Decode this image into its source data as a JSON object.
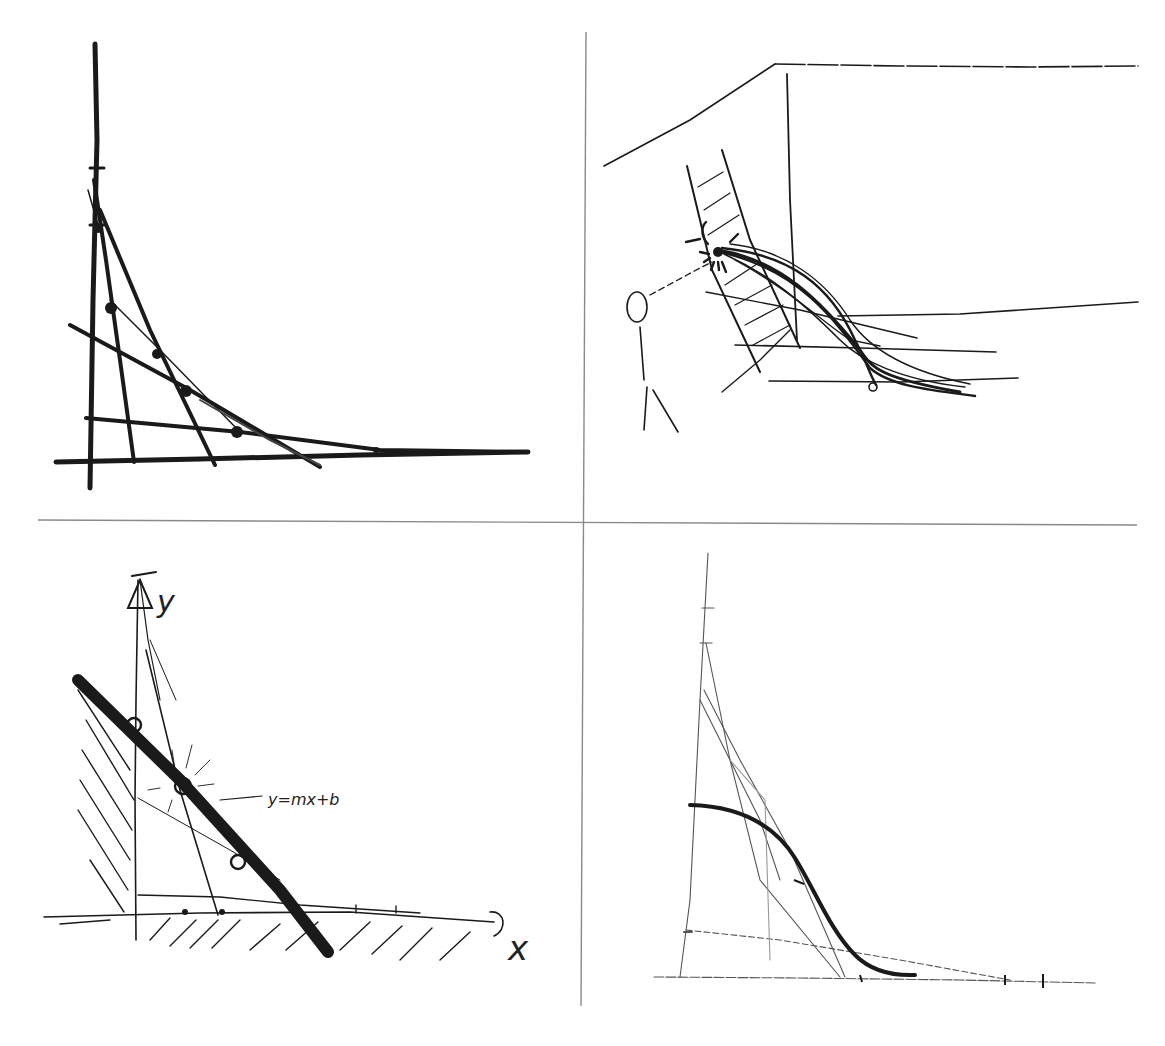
{
  "page": {
    "background": "#ffffff",
    "ink_color": "#1a1a1a",
    "divider_color": "#8a8a8a",
    "layout": "2x2 grid of hand-drawn pencil/ink sketches separated by thin gray lines"
  },
  "panels": [
    {
      "id": "top-left",
      "description": "Curve of pursuit / envelope: vertical and horizontal axes with straight tangent lines forming a concave curve, dots marking tangent points",
      "labels": []
    },
    {
      "id": "top-right",
      "description": "Perspective room corner with a ladder leaning on the wall; stick figure looking at a glowing point where a bundle of curves begins, curves sweeping down to the floor",
      "labels": []
    },
    {
      "id": "bottom-left",
      "description": "Cartesian axes with a bold straight line, hatched regions, circled points and an annotated equation",
      "labels": {
        "y_axis": "y",
        "x_axis": "x",
        "equation": "y=mx+b"
      }
    },
    {
      "id": "bottom-right",
      "description": "Light pencil construction: tall triangle with a smooth bold S-shaped decay curve tangent to construction lines, tick marks on baseline",
      "labels": []
    }
  ]
}
